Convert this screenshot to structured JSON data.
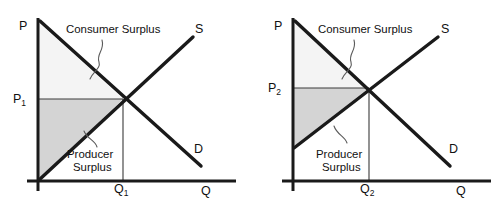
{
  "diagram": {
    "type": "supply-demand",
    "colors": {
      "consumer_surplus_fill": "#f4f4f4",
      "producer_surplus_fill": "#d4d4d4",
      "curve_stroke": "#1a1a1a",
      "axis_stroke": "#1a1a1a",
      "background": "#ffffff"
    }
  },
  "panels": [
    {
      "id": "left-panel",
      "axis": {
        "y_label": "P",
        "x_label": "Q"
      },
      "curves": [
        {
          "name": "supply",
          "label": "S"
        },
        {
          "name": "demand",
          "label": "D"
        }
      ],
      "price_label": "P",
      "price_sub": "1",
      "quantity_label": "Q",
      "quantity_sub": "1",
      "annotations": [
        {
          "name": "consumer-surplus",
          "line1": "Consumer Surplus",
          "line2": ""
        },
        {
          "name": "producer-surplus",
          "line1": "Producer",
          "line2": "Surplus"
        }
      ]
    },
    {
      "id": "right-panel",
      "axis": {
        "y_label": "P",
        "x_label": "Q"
      },
      "curves": [
        {
          "name": "supply",
          "label": "S"
        },
        {
          "name": "demand",
          "label": "D"
        }
      ],
      "price_label": "P",
      "price_sub": "2",
      "quantity_label": "Q",
      "quantity_sub": "2",
      "annotations": [
        {
          "name": "consumer-surplus",
          "line1": "Consumer Surplus",
          "line2": ""
        },
        {
          "name": "producer-surplus",
          "line1": "Producer",
          "line2": "Surplus"
        }
      ]
    }
  ]
}
